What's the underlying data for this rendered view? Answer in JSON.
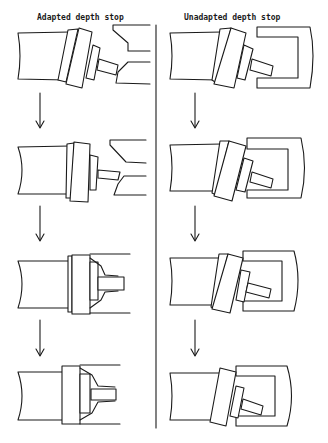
{
  "diagram": {
    "columns": [
      {
        "id": "adapted",
        "title": "Adapted depth stop",
        "steps": 4
      },
      {
        "id": "unadapted",
        "title": "Unadapted depth stop",
        "steps": 4
      }
    ],
    "divider": true,
    "arrows": {
      "left": 3,
      "right": 3
    },
    "colors": {
      "line": "#1a1a1a",
      "background": "#ffffff"
    }
  }
}
